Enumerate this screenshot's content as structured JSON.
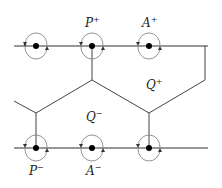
{
  "diagram": {
    "colors": {
      "line": "#333333",
      "loop": "#666666",
      "dot": "#000000",
      "background": "#ffffff"
    },
    "lines": {
      "top": {
        "y": 46,
        "x1": 14,
        "x2": 208
      },
      "bottom": {
        "y": 148,
        "x1": 14,
        "x2": 208
      }
    },
    "top_points": [
      36,
      92,
      149
    ],
    "bottom_points": [
      36,
      92,
      149
    ],
    "labels": [
      {
        "id": "P-plus",
        "base": "P",
        "sup": "+",
        "x": 86,
        "y": 26
      },
      {
        "id": "A-plus",
        "base": "A",
        "sup": "+",
        "x": 143,
        "y": 26
      },
      {
        "id": "Q-plus",
        "base": "Q",
        "sup": "+",
        "x": 146,
        "y": 89
      },
      {
        "id": "Q-minus",
        "base": "Q",
        "sup": "−",
        "x": 86,
        "y": 121
      },
      {
        "id": "P-minus",
        "base": "P",
        "sup": "−",
        "x": 29,
        "y": 174
      },
      {
        "id": "A-minus",
        "base": "A",
        "sup": "−",
        "x": 86,
        "y": 174
      }
    ]
  }
}
